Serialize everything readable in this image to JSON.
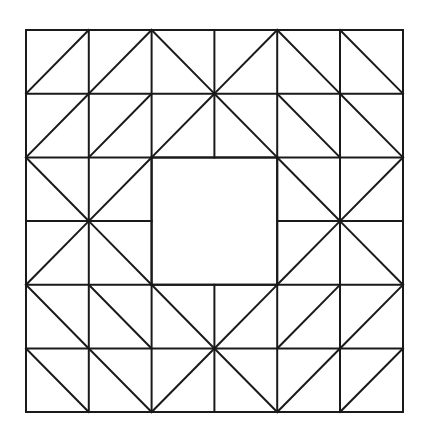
{
  "canvas": {
    "width": 421,
    "height": 433,
    "background_color": "#ffffff",
    "title": "Quilt Block Pattern"
  },
  "figure": {
    "name": "geometric-quilt-block",
    "stroke_color": "#1a1a1a",
    "stroke_width": 2,
    "fill_color": "none"
  },
  "grid": {
    "origin_x": 26,
    "origin_y": 30,
    "columns": 6,
    "rows": 6,
    "cell_width": 62.8,
    "cell_height": 63.7,
    "total_width": 377,
    "total_height": 382,
    "column_edges_x": [
      26,
      88.8,
      151.6,
      214.4,
      277.2,
      340,
      403
    ],
    "row_edges_y": [
      30,
      93.7,
      157.4,
      221.1,
      284.8,
      348.5,
      412
    ]
  },
  "center_block": {
    "name": "empty-center-square",
    "col_start": 2,
    "col_end": 4,
    "row_start": 2,
    "row_end": 4,
    "x": 151.6,
    "y": 157.4,
    "width": 125.6,
    "height": 127.4
  },
  "diagonals": {
    "legend": {
      "slash": "line from bottom-left corner to top-right corner",
      "backslash": "line from top-left corner to bottom-right corner",
      "none": "cell has no diagonal"
    },
    "rows": [
      [
        "slash",
        "slash",
        "backslash",
        "slash",
        "backslash",
        "backslash"
      ],
      [
        "slash",
        "slash",
        "slash",
        "backslash",
        "backslash",
        "backslash"
      ],
      [
        "backslash",
        "slash",
        "none",
        "none",
        "backslash",
        "slash"
      ],
      [
        "slash",
        "backslash",
        "none",
        "none",
        "slash",
        "backslash"
      ],
      [
        "backslash",
        "backslash",
        "backslash",
        "slash",
        "slash",
        "slash"
      ],
      [
        "backslash",
        "backslash",
        "slash",
        "backslash",
        "slash",
        "slash"
      ]
    ]
  },
  "interior_lines": {
    "note": "Interior grid lines are suppressed where they would cross the empty central square",
    "vertical_suppressed": [
      {
        "x_index": 3,
        "row_start": 2,
        "row_end": 4
      }
    ],
    "horizontal_suppressed": [
      {
        "y_index": 3,
        "col_start": 2,
        "col_end": 4
      }
    ]
  }
}
